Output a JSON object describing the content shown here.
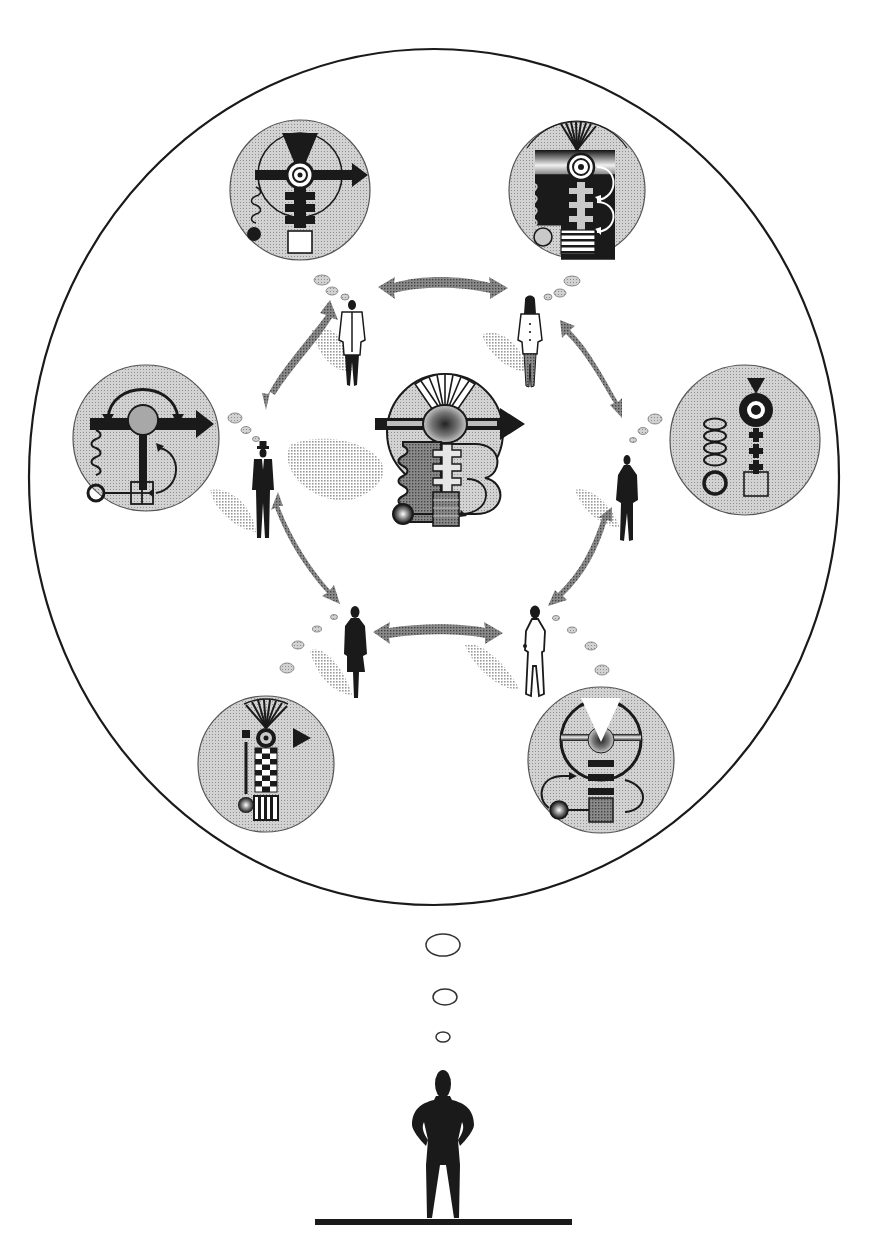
{
  "canvas": {
    "width": 880,
    "height": 1257,
    "background": "#ffffff"
  },
  "colors": {
    "ink": "#1a1a1a",
    "medallion_fill": "#c9c9c9",
    "medallion_stroke": "#555555",
    "arrow_gray": "#8a8a8a",
    "shadow_gray": "#b5b5b5",
    "bubble_fill": "#cfcfcf",
    "center_light": "#bdbdbd",
    "center_dark": "#6a6a6a",
    "white": "#ffffff"
  },
  "outer_thought_circle": {
    "cx": 434,
    "cy": 477,
    "rx": 405,
    "ry": 428
  },
  "medallions": [
    {
      "id": "top-left",
      "cx": 300,
      "cy": 190,
      "r": 70,
      "motif": "radiating-target-with-horizontal-arrow-spring-ball-square"
    },
    {
      "id": "top-right",
      "cx": 577,
      "cy": 190,
      "r": 68,
      "motif": "fan-target-ladder-curved-arrows-striped-block"
    },
    {
      "id": "left",
      "cx": 146,
      "cy": 438,
      "r": 73,
      "motif": "t-bar-arrow-swap-arrows-spring-grid"
    },
    {
      "id": "right",
      "cx": 745,
      "cy": 440,
      "r": 75,
      "motif": "triangle-target-crosses-ovals-circle-square"
    },
    {
      "id": "bottom-left",
      "cx": 266,
      "cy": 764,
      "r": 68,
      "motif": "fan-checkerboard-column-lever-triangle"
    },
    {
      "id": "bottom-right",
      "cx": 601,
      "cy": 760,
      "r": 73,
      "motif": "wheel-funnel-bars-loop-arrow"
    }
  ],
  "center_machine": {
    "cx": 445,
    "cy": 444,
    "motif": "central-combined-mechanism"
  },
  "people": [
    {
      "id": "man-top-left",
      "x": 352,
      "y": 300,
      "style": "white-jacket"
    },
    {
      "id": "woman-top-right",
      "x": 530,
      "y": 298,
      "style": "white-jacket-long-hair"
    },
    {
      "id": "man-left",
      "x": 263,
      "y": 452,
      "style": "dark-suit-hat"
    },
    {
      "id": "person-right",
      "x": 627,
      "y": 455,
      "style": "dark-silhouette"
    },
    {
      "id": "woman-bottom-left",
      "x": 355,
      "y": 610,
      "style": "dark-dress"
    },
    {
      "id": "person-bottom-right",
      "x": 535,
      "y": 608,
      "style": "white-outline-coat"
    }
  ],
  "observer": {
    "x": 440,
    "y": 1070,
    "ground_y": 1222,
    "ground_x1": 315,
    "ground_x2": 572
  },
  "observer_bubbles": [
    {
      "cx": 443,
      "cy": 945,
      "rx": 17,
      "ry": 11
    },
    {
      "cx": 445,
      "cy": 997,
      "rx": 12,
      "ry": 8
    },
    {
      "cx": 443,
      "cy": 1037,
      "rx": 7,
      "ry": 5
    }
  ],
  "labels": {
    "figure_title": "",
    "caption": ""
  }
}
